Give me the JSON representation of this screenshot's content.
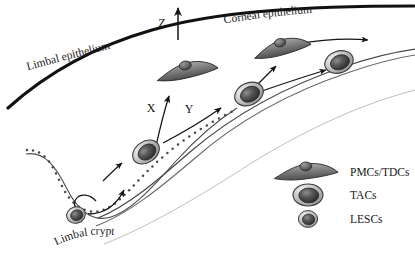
{
  "figure": {
    "background_color": "#ffffff",
    "width": 415,
    "height": 262
  },
  "labels": {
    "limbal_epithelium": "Limbal epithelium",
    "corneal_epithelium": "Corneal epithelium",
    "limbal_crypt": "Limbal crypt"
  },
  "axes": {
    "z": "Z",
    "x": "X",
    "y": "Y"
  },
  "legend": {
    "items": [
      {
        "label": "PMCs/TDCs",
        "shape": "flat-wing-cell"
      },
      {
        "label": "TACs",
        "shape": "oval-cell"
      },
      {
        "label": "LESCs",
        "shape": "small-round-cell"
      }
    ]
  },
  "colors": {
    "outline": "#111111",
    "membrane": "#3a3a3a",
    "cell_body_light": "#d9d9d9",
    "cell_body_mid": "#9a9a9a",
    "nucleus_dark": "#2e2e2e",
    "nucleus_mid": "#5c5c5c",
    "stipple": "#4a4a4a",
    "arrow": "#151515",
    "background": "#ffffff"
  },
  "cells": {
    "crypt_lesc": {
      "type": "LESCs",
      "cx": 76,
      "cy": 215
    },
    "basal_tac_lower": {
      "type": "TACs",
      "cx": 146,
      "cy": 152
    },
    "basal_tac_mid": {
      "type": "TACs",
      "cx": 249,
      "cy": 94
    },
    "basal_tac_upper": {
      "type": "TACs",
      "cx": 339,
      "cy": 62
    },
    "suprabasal_pmc_left": {
      "type": "PMCs/TDCs",
      "cx": 186,
      "cy": 70
    },
    "suprabasal_pmc_right": {
      "type": "PMCs/TDCs",
      "cx": 281,
      "cy": 47
    }
  }
}
